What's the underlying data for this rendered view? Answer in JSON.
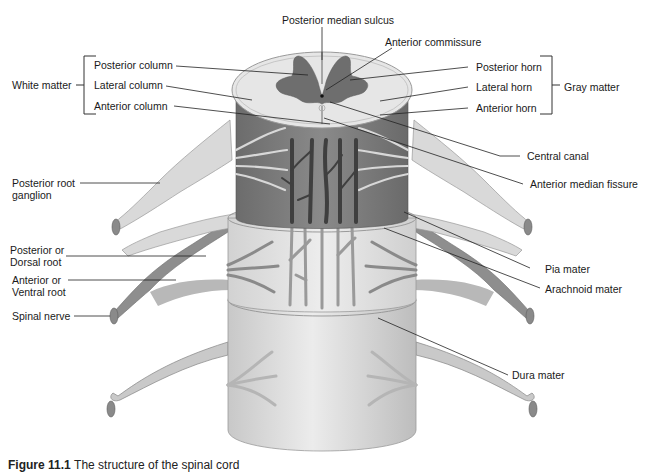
{
  "diagram": {
    "groups": {
      "white_matter": "White matter",
      "gray_matter": "Gray matter"
    },
    "labels": {
      "posterior_median_sulcus": "Posterior median sulcus",
      "anterior_commissure": "Anterior commissure",
      "posterior_column": "Posterior column",
      "lateral_column": "Lateral column",
      "anterior_column": "Anterior column",
      "posterior_horn": "Posterior horn",
      "lateral_horn": "Lateral horn",
      "anterior_horn": "Anterior horn",
      "central_canal": "Central canal",
      "anterior_median_fissure": "Anterior median fissure",
      "posterior_root_ganglion_1": "Posterior root",
      "posterior_root_ganglion_2": "ganglion",
      "posterior_dorsal_root_1": "Posterior or",
      "posterior_dorsal_root_2": "Dorsal root",
      "anterior_ventral_root_1": "Anterior or",
      "anterior_ventral_root_2": "Ventral root",
      "spinal_nerve": "Spinal nerve",
      "pia_mater": "Pia mater",
      "arachnoid_mater": "Arachnoid mater",
      "dura_mater": "Dura mater"
    },
    "caption": {
      "figure_label": "Figure 11.1",
      "text": "The structure of the spinal cord"
    },
    "colors": {
      "gray_matter": "#6e6e6e",
      "white_matter": "#e4e4e4",
      "pia_dark": "#7a7a7a",
      "arachnoid": "#d8d8d8",
      "dura": "#dadada",
      "root_dark": "#8c8c8c",
      "root_light": "#d4d4d4",
      "vessel": "#4e4e4e",
      "line": "#222222"
    }
  }
}
